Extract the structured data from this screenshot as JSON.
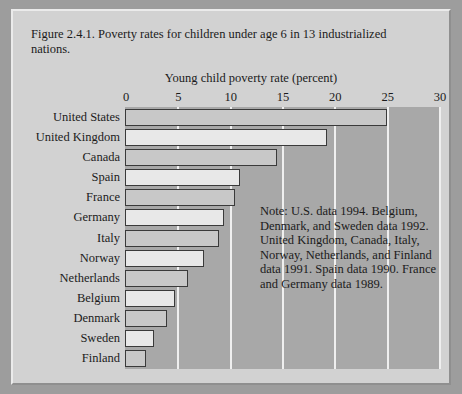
{
  "figure": {
    "title": "Figure 2.4.1. Poverty rates for children under  age 6 in 13 industrialized nations.",
    "note": "Note: U.S. data 1994. Belgium, Denmark, and Sweden data 1992. United Kingdom, Canada, Italy, Norway, Netherlands, and Finland data 1991. Spain data 1990. France and Germany data 1989."
  },
  "colors": {
    "page_background": "#9d9d9d",
    "figure_background": "#d2d2d2",
    "plot_background": "#a8a8a8",
    "gridline": "#efefef",
    "bar_dark": "#c8c8c8",
    "bar_light": "#e8e8e8",
    "bar_outline": "#3a3a3a",
    "text": "#1b1b1b"
  },
  "chart_data": {
    "type": "bar",
    "orientation": "horizontal",
    "title": "Figure 2.4.1. Poverty rates for children under  age 6 in 13 industrialized nations.",
    "xlabel": "Young child poverty rate (percent)",
    "ylabel": "",
    "categories": [
      "United States",
      "United Kingdom",
      "Canada",
      "Spain",
      "France",
      "Germany",
      "Italy",
      "Norway",
      "Netherlands",
      "Belgium",
      "Denmark",
      "Sweden",
      "Finland"
    ],
    "values": [
      25.0,
      19.3,
      14.5,
      11.0,
      10.5,
      9.5,
      9.0,
      7.5,
      6.0,
      4.8,
      4.0,
      2.8,
      2.0
    ],
    "xlim": [
      0,
      30
    ],
    "xticks": [
      0,
      5,
      10,
      15,
      20,
      25,
      30
    ],
    "xtick_labels": [
      "0",
      "5",
      "10",
      "15",
      "20",
      "25",
      "30"
    ],
    "grid": true,
    "grid_axis": "x",
    "legend": false,
    "annotations": [
      "Note: U.S. data 1994. Belgium, Denmark, and Sweden data 1992. United Kingdom, Canada, Italy, Norway, Netherlands, and Finland data 1991. Spain data 1990. France and Germany data 1989."
    ]
  }
}
